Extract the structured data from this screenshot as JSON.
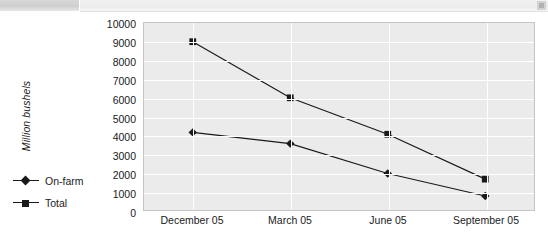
{
  "toolbar": {
    "corner_icon": "resize-grip-icon"
  },
  "chart_data": {
    "type": "line",
    "title": "",
    "subtitle": "",
    "xlabel": "",
    "ylabel": "Million bushels",
    "categories": [
      "December 05",
      "March 05",
      "June 05",
      "September 05"
    ],
    "series": [
      {
        "name": "On-farm",
        "marker": "diamond",
        "color": "#1a1a1a",
        "values": [
          4150,
          3550,
          1950,
          750
        ]
      },
      {
        "name": "Total",
        "marker": "square",
        "color": "#1a1a1a",
        "values": [
          9000,
          6000,
          4050,
          1650
        ]
      }
    ],
    "ylim": [
      0,
      10000
    ],
    "ytick_labels": [
      "10000",
      "9000",
      "8000",
      "7000",
      "6000",
      "5000",
      "4000",
      "3000",
      "2000",
      "1000",
      "0"
    ],
    "ytick_values": [
      10000,
      9000,
      8000,
      7000,
      6000,
      5000,
      4000,
      3000,
      2000,
      1000,
      0
    ],
    "grid": true,
    "grid_color": "#ffffff",
    "plot_background": "#ebebeb",
    "legend_position": "bottom-left-outside",
    "legend_entries": [
      "On-farm",
      "Total"
    ]
  }
}
